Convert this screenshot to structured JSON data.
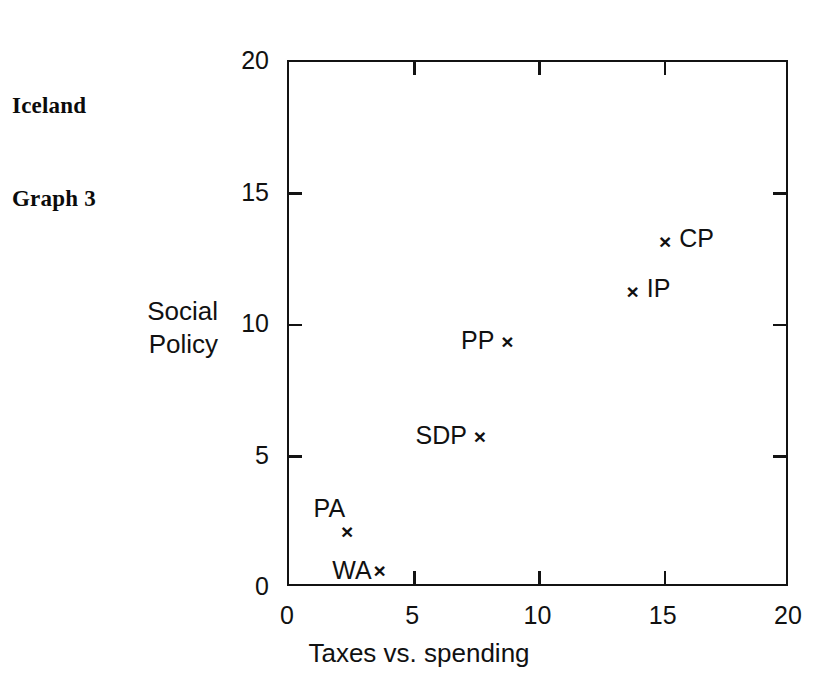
{
  "caption": {
    "line1": "Iceland",
    "line2": "Graph 3"
  },
  "chart_data": {
    "type": "scatter",
    "title": "Iceland Graph 3",
    "xlabel": "Taxes vs. spending",
    "ylabel": "Social Policy",
    "ylabel_line1": "Social",
    "ylabel_line2": "Policy",
    "xlim": [
      0,
      20
    ],
    "ylim": [
      0,
      20
    ],
    "xticks": [
      0,
      5,
      10,
      15,
      20
    ],
    "yticks": [
      0,
      5,
      10,
      15,
      20
    ],
    "xtick_labels": [
      "0",
      "5",
      "10",
      "15",
      "20"
    ],
    "ytick_labels": [
      "0",
      "5",
      "10",
      "15",
      "20"
    ],
    "grid": false,
    "legend": "none",
    "marker": "x",
    "points": [
      {
        "label": "WA",
        "x": 3.7,
        "y": 0.6,
        "label_pos": "left-tight"
      },
      {
        "label": "PA",
        "x": 2.4,
        "y": 2.1,
        "label_pos": "up-left"
      },
      {
        "label": "SDP",
        "x": 7.7,
        "y": 5.7,
        "label_pos": "left"
      },
      {
        "label": "PP",
        "x": 8.8,
        "y": 9.3,
        "label_pos": "left"
      },
      {
        "label": "IP",
        "x": 13.8,
        "y": 11.2,
        "label_pos": "right"
      },
      {
        "label": "CP",
        "x": 15.1,
        "y": 13.1,
        "label_pos": "right"
      }
    ]
  },
  "colors": {
    "background": "#ffffff",
    "ink": "#111111",
    "axis": "#131313"
  }
}
